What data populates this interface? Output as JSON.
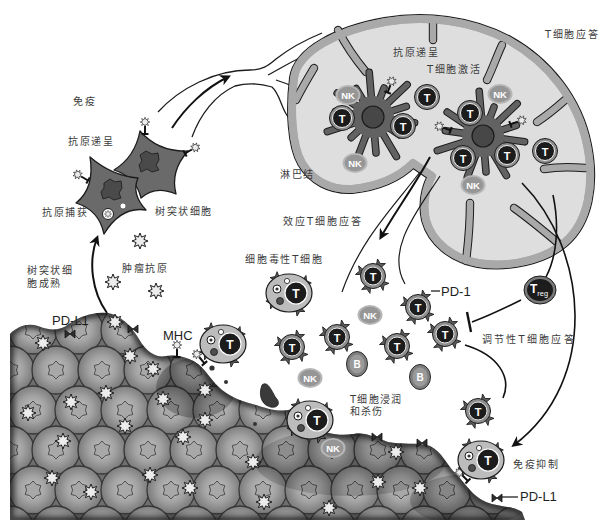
{
  "diagram": {
    "labels": {
      "immunity": "免疫",
      "antigen_presentation_periphery": "抗原递呈",
      "antigen_capture": "抗原捕获",
      "dendritic_cell": "树突状细胞",
      "dendritic_cell_maturation": [
        "树突状细",
        "胞成熟"
      ],
      "tumor_antigen": "肿瘤抗原",
      "pd_l1_tumor_top": "PD-L1",
      "mhc": "MHC",
      "lymph_node": "淋巴结",
      "antigen_presentation_node": "抗原递呈",
      "t_cell_activation": "T细胞激活",
      "t_cell_response": "T细胞应答",
      "effector_t_cell_response": "效应T细胞应答",
      "cytotoxic_t_cell": "细胞毒性T细胞",
      "pd_1": "PD-1",
      "regulatory_t_cell_response": "调节性T细胞应答",
      "t_cell_infiltration_killing": [
        "T细胞浸润",
        "和杀伤"
      ],
      "immune_suppression": "免疫抑制",
      "pd_l1_tumor_bottom": "PD-L1"
    },
    "cells": [
      {
        "type": "dc-mature",
        "x": 373,
        "y": 117
      },
      {
        "type": "dc-mature",
        "x": 483,
        "y": 136
      },
      {
        "type": "nk",
        "label": "NK",
        "x": 348,
        "y": 95
      },
      {
        "type": "nk",
        "label": "NK",
        "x": 355,
        "y": 163
      },
      {
        "type": "nk",
        "label": "NK",
        "x": 500,
        "y": 94
      },
      {
        "type": "nk",
        "label": "NK",
        "x": 473,
        "y": 185
      },
      {
        "type": "t-node",
        "label": "T",
        "x": 342,
        "y": 118
      },
      {
        "type": "t-node",
        "label": "T",
        "x": 427,
        "y": 97
      },
      {
        "type": "t-node",
        "label": "T",
        "x": 403,
        "y": 126
      },
      {
        "type": "t-node",
        "label": "T",
        "x": 470,
        "y": 113
      },
      {
        "type": "t-node",
        "label": "T",
        "x": 463,
        "y": 158
      },
      {
        "type": "t-node",
        "label": "T",
        "x": 507,
        "y": 155
      },
      {
        "type": "t-node",
        "label": "T",
        "x": 545,
        "y": 151
      },
      {
        "type": "t-effector",
        "label": "T",
        "x": 373,
        "y": 276
      },
      {
        "type": "t-effector",
        "label": "T",
        "x": 418,
        "y": 307
      },
      {
        "type": "t-effector",
        "label": "T",
        "x": 445,
        "y": 334
      },
      {
        "type": "t-effector",
        "label": "T",
        "x": 337,
        "y": 337
      },
      {
        "type": "t-effector",
        "label": "T",
        "x": 397,
        "y": 346
      },
      {
        "type": "t-effector",
        "label": "T",
        "x": 292,
        "y": 347
      },
      {
        "type": "t-effector",
        "label": "T",
        "x": 478,
        "y": 411
      },
      {
        "type": "nk",
        "label": "NK",
        "x": 370,
        "y": 315
      },
      {
        "type": "nk",
        "label": "NK",
        "x": 310,
        "y": 378
      },
      {
        "type": "b",
        "label": "B",
        "x": 357,
        "y": 364
      },
      {
        "type": "b",
        "label": "B",
        "x": 420,
        "y": 377
      },
      {
        "type": "ctl",
        "label": "T",
        "x": 289,
        "y": 293
      },
      {
        "type": "ctl",
        "label": "T",
        "x": 223,
        "y": 344
      },
      {
        "type": "ctl",
        "label": "T",
        "x": 310,
        "y": 420
      },
      {
        "type": "nk",
        "label": "NK",
        "x": 333,
        "y": 448
      },
      {
        "type": "ctl",
        "label": "T",
        "x": 481,
        "y": 460
      },
      {
        "type": "treg",
        "label": "T",
        "sub": "reg",
        "x": 540,
        "y": 290
      }
    ]
  },
  "colors": {
    "background": "#ffffff",
    "label_text": "#3c3c3c",
    "lymph_node_fill": "#dedede",
    "lymph_node_capsule": "#a9a9a9",
    "dendritic_cell": "#626262",
    "t_cell_core": "#1c1c1c",
    "t_cell_ring": "#8d8d8d",
    "nk_cell": "#969696",
    "b_cell": "#7e7e7e",
    "cytotoxic_body": "#bcbcbc",
    "tumor": "#8a8a8a"
  }
}
